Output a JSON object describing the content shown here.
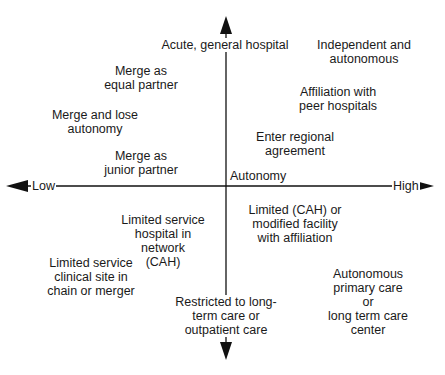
{
  "diagram": {
    "type": "quadrant",
    "colors": {
      "axis": "#111111",
      "text": "#1a1a1a",
      "background": "#ffffff"
    },
    "axes": {
      "horizontal": {
        "name": "Autonomy",
        "low_label": "Low",
        "high_label": "High"
      },
      "vertical": {
        "top_label": "Acute, general hospital",
        "bottom_label": "Restricted to long-\nterm care or\noutpatient care"
      }
    },
    "quadrants": {
      "top_left": [
        {
          "text": "Merge as\nequal partner"
        },
        {
          "text": "Merge and lose\nautonomy"
        },
        {
          "text": "Merge as\njunior partner"
        }
      ],
      "top_right": [
        {
          "text": "Independent and\nautonomous"
        },
        {
          "text": "Affiliation with\npeer hospitals"
        },
        {
          "text": "Enter regional\nagreement"
        }
      ],
      "bottom_left": [
        {
          "text": "Limited service\nhospital in network\n(CAH)"
        },
        {
          "text": "Limited service\nclinical site in\nchain or merger"
        }
      ],
      "bottom_right": [
        {
          "text": "Limited  (CAH) or\nmodified facility\nwith affiliation"
        },
        {
          "text": "Autonomous\nprimary care or\nlong term care\ncenter"
        }
      ]
    }
  }
}
